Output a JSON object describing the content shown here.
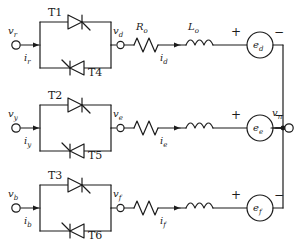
{
  "diagram": {
    "type": "circuit-schematic",
    "stroke_color": "#1b1b1b",
    "background_color": "#ffffff",
    "rows": [
      {
        "id": "row-r",
        "input_voltage": "v",
        "input_voltage_sub": "r",
        "input_current": "i",
        "input_current_sub": "r",
        "thyristor_top": "T1",
        "thyristor_bottom": "T4",
        "mid_voltage": "v",
        "mid_voltage_sub": "d",
        "resistor_label": "R",
        "resistor_label_sub": "o",
        "inductor_label": "L",
        "inductor_label_sub": "o",
        "branch_current": "i",
        "branch_current_sub": "d",
        "source_label": "e",
        "source_label_sub": "d",
        "plus": "+",
        "minus": "−"
      },
      {
        "id": "row-y",
        "input_voltage": "v",
        "input_voltage_sub": "y",
        "input_current": "i",
        "input_current_sub": "y",
        "thyristor_top": "T2",
        "thyristor_bottom": "T5",
        "mid_voltage": "v",
        "mid_voltage_sub": "e",
        "resistor_label": "",
        "resistor_label_sub": "",
        "inductor_label": "",
        "inductor_label_sub": "",
        "branch_current": "i",
        "branch_current_sub": "e",
        "source_label": "e",
        "source_label_sub": "e",
        "plus": "+",
        "minus": "−"
      },
      {
        "id": "row-b",
        "input_voltage": "v",
        "input_voltage_sub": "b",
        "input_current": "i",
        "input_current_sub": "b",
        "thyristor_top": "T3",
        "thyristor_bottom": "T6",
        "mid_voltage": "v",
        "mid_voltage_sub": "f",
        "resistor_label": "",
        "resistor_label_sub": "",
        "inductor_label": "",
        "inductor_label_sub": "",
        "branch_current": "i",
        "branch_current_sub": "f",
        "source_label": "e",
        "source_label_sub": "f",
        "plus": "+",
        "minus": "−"
      }
    ],
    "neutral": {
      "label": "v",
      "label_sub": "n"
    }
  }
}
